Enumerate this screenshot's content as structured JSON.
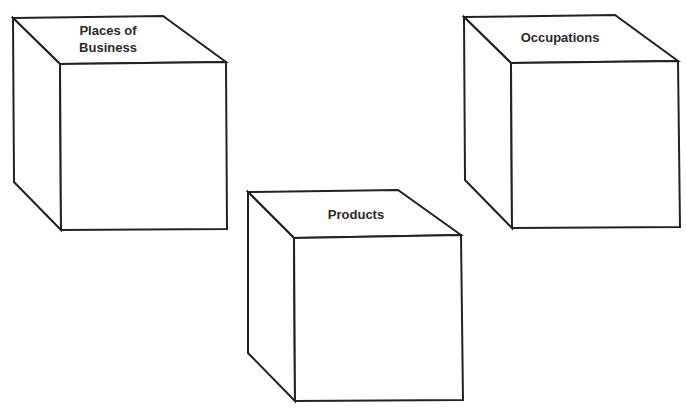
{
  "diagram": {
    "background": "#ffffff",
    "line_color": "#222222",
    "cubes": [
      {
        "id": "places-of-business",
        "label_lines": [
          "Places of",
          "Business"
        ],
        "points": {
          "back_top_left": [
            13,
            18
          ],
          "back_top_right": [
            163,
            16
          ],
          "front_top_right": [
            226,
            62
          ],
          "front_top_left": [
            60,
            64
          ],
          "front_bottom_right": [
            227,
            229
          ],
          "front_bottom_left": [
            61,
            230
          ],
          "back_bottom_left": [
            14,
            182
          ]
        },
        "label_pos": [
          [
            108,
            35
          ],
          [
            108,
            52
          ]
        ]
      },
      {
        "id": "occupations",
        "label_lines": [
          "Occupations"
        ],
        "points": {
          "back_top_left": [
            464,
            17
          ],
          "back_top_right": [
            615,
            15
          ],
          "front_top_right": [
            678,
            61
          ],
          "front_top_left": [
            511,
            63
          ],
          "front_bottom_right": [
            680,
            227
          ],
          "front_bottom_left": [
            512,
            228
          ],
          "back_bottom_left": [
            465,
            180
          ]
        },
        "label_pos": [
          [
            560,
            42
          ]
        ]
      },
      {
        "id": "products",
        "label_lines": [
          "Products"
        ],
        "points": {
          "back_top_left": [
            248,
            192
          ],
          "back_top_right": [
            398,
            190
          ],
          "front_top_right": [
            461,
            235
          ],
          "front_top_left": [
            294,
            238
          ],
          "front_bottom_right": [
            463,
            400
          ],
          "front_bottom_left": [
            295,
            401
          ],
          "back_bottom_left": [
            248,
            353
          ]
        },
        "label_pos": [
          [
            356,
            219
          ]
        ]
      }
    ]
  }
}
